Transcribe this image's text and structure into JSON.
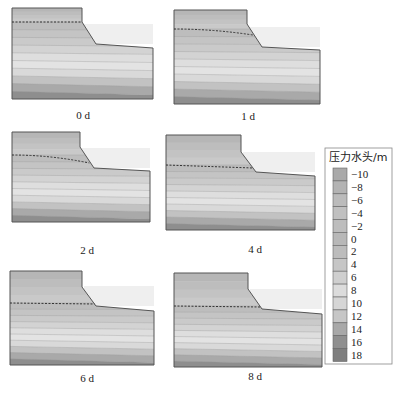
{
  "figure": {
    "type": "contour-panels",
    "panels": [
      {
        "label": "0 d",
        "time_days": 0,
        "outline": {
          "left": 12,
          "top": 8,
          "crest_x": 82,
          "break_y": 22,
          "toe_x": 96,
          "toe_y": 44,
          "right": 153,
          "right_y": 48,
          "bottom": 99
        },
        "phreatic_y_left": 22,
        "phreatic_y_crest": 22,
        "phreatic_curve": 0,
        "label_x": 83,
        "label_y": 119
      },
      {
        "label": "1 d",
        "time_days": 1,
        "outline": {
          "left": 174,
          "top": 10,
          "crest_x": 247,
          "break_y": 24,
          "toe_x": 262,
          "toe_y": 47,
          "right": 320,
          "right_y": 50,
          "bottom": 104
        },
        "phreatic_y_left": 29,
        "phreatic_y_crest": 33,
        "phreatic_curve": 1,
        "label_x": 248,
        "label_y": 120
      },
      {
        "label": "2 d",
        "time_days": 2,
        "outline": {
          "left": 12,
          "top": 132,
          "crest_x": 80,
          "break_y": 147,
          "toe_x": 94,
          "toe_y": 168,
          "right": 150,
          "right_y": 171,
          "bottom": 222
        },
        "phreatic_y_left": 155,
        "phreatic_y_crest": 161,
        "phreatic_curve": 1,
        "label_x": 87,
        "label_y": 254
      },
      {
        "label": "4 d",
        "time_days": 4,
        "outline": {
          "left": 166,
          "top": 135,
          "crest_x": 241,
          "break_y": 152,
          "toe_x": 256,
          "toe_y": 172,
          "right": 315,
          "right_y": 176,
          "bottom": 230
        },
        "phreatic_y_left": 165,
        "phreatic_y_crest": 168,
        "phreatic_curve": 0,
        "label_x": 255,
        "label_y": 253
      },
      {
        "label": "6 d",
        "time_days": 6,
        "outline": {
          "left": 10,
          "top": 271,
          "crest_x": 82,
          "break_y": 287,
          "toe_x": 96,
          "toe_y": 306,
          "right": 154,
          "right_y": 311,
          "bottom": 365
        },
        "phreatic_y_left": 303,
        "phreatic_y_crest": 304,
        "phreatic_curve": 0,
        "label_x": 87,
        "label_y": 382
      },
      {
        "label": "8 d",
        "time_days": 8,
        "outline": {
          "left": 174,
          "top": 273,
          "crest_x": 248,
          "break_y": 289,
          "toe_x": 262,
          "toe_y": 309,
          "right": 322,
          "right_y": 314,
          "bottom": 367
        },
        "phreatic_y_left": 306,
        "phreatic_y_crest": 307,
        "phreatic_curve": 0,
        "label_x": 255,
        "label_y": 380
      }
    ]
  },
  "legend": {
    "title": "压力水头/m",
    "ticks": [
      "−10",
      "−8",
      "−6",
      "−4",
      "−2",
      "0",
      "2",
      "4",
      "6",
      "8",
      "10",
      "12",
      "14",
      "16",
      "18"
    ],
    "colors": [
      "#a9a9a9",
      "#b3b3b3",
      "#bbbbbb",
      "#c0c0c0",
      "#bdbdbd",
      "#b8b8b8",
      "#bcbcbc",
      "#c6c6c6",
      "#cfcfcf",
      "#dcdcdc",
      "#d6d6d6",
      "#c6c6c6",
      "#a8a8a8",
      "#8f8f8f",
      "#7e7e7e"
    ]
  },
  "chart_data": {
    "type": "heatmap",
    "title": "",
    "panels": [
      "0 d",
      "1 d",
      "2 d",
      "4 d",
      "6 d",
      "8 d"
    ],
    "colorbar": {
      "label": "压力水头/m",
      "range": [
        -10,
        18
      ],
      "ticks": [
        -10,
        -8,
        -6,
        -4,
        -2,
        0,
        2,
        4,
        6,
        8,
        10,
        12,
        14,
        16,
        18
      ]
    },
    "annotations": [
      "dashed line = phreatic surface (zero pressure head)"
    ],
    "phreatic_surface_trend": "Water table in the slope crest lowers and flattens over time from 0 d to 8 d"
  },
  "bands": {
    "fill_top": [
      "#b6b6b6",
      "#bdbdbd",
      "#c3c3c3",
      "#c9c9c9"
    ],
    "fill_below": [
      "#bdbdbd",
      "#c4c4c4",
      "#cacaca",
      "#d3d3d3",
      "#dedede",
      "#e3e3e3",
      "#d9d9d9",
      "#c2c2c2",
      "#a9a9a9",
      "#8e8e8e"
    ],
    "outline_color": "#555555",
    "phreatic_color": "#333333",
    "sky_shade": "#efefef"
  }
}
